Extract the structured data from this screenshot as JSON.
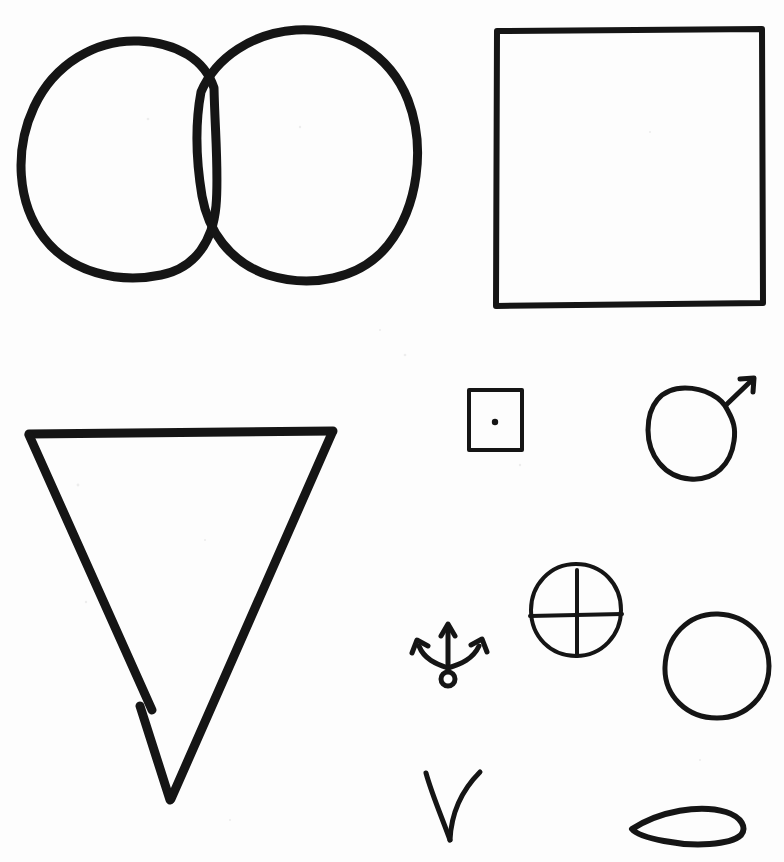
{
  "page": {
    "title": "Hand-drawn shapes sheet",
    "description": "Scanned sheet of hand-drawn black ink shapes on white paper",
    "width": 784,
    "height": 862,
    "background_color": "#fdfdfd",
    "ink_color": "#151515"
  },
  "shapes": [
    {
      "id": "two-overlapping-circles",
      "name": "two-overlapping-circles",
      "label": "Two overlapping circles (Venn / vesica)",
      "kind": "outline",
      "stroke_width": 9,
      "bbox": [
        22,
        28,
        398,
        255
      ],
      "parts": [
        {
          "part": "left-circle",
          "path": "M 214 88 C 205 60 178 43 139 41 C 96 39 54 64 34 107 C 14 150 17 203 44 238 C 70 272 118 284 161 275 C 196 268 213 240 216 206 C 219 174 215 133 214 88 Z"
        },
        {
          "part": "right-circle",
          "path": "M 201 92 C 216 57 253 33 296 30 C 345 27 390 54 408 100 C 426 147 418 207 388 245 C 360 280 310 288 268 275 C 229 262 208 230 202 196 C 196 160 195 124 201 92 Z"
        }
      ]
    },
    {
      "id": "large-square",
      "name": "large-square",
      "label": "Large hand-drawn square outline",
      "kind": "outline",
      "stroke_width": 6,
      "bbox": [
        494,
        27,
        270,
        280
      ],
      "parts": [
        {
          "part": "square-outline",
          "path": "M 497 31 L 762 29 L 763 303 L 496 306 Z"
        }
      ]
    },
    {
      "id": "inverted-triangle",
      "name": "inverted-triangle",
      "label": "Downward-pointing triangle with a small gap in the lower-left edge",
      "kind": "outline",
      "stroke_width": 9,
      "bbox": [
        26,
        428,
        310,
        375
      ],
      "vertices": [
        [
          29,
          433
        ],
        [
          332,
          432
        ],
        [
          170,
          800
        ]
      ],
      "parts": [
        {
          "part": "top-edge",
          "path": "M 29 434 L 333 431"
        },
        {
          "part": "right-edge",
          "path": "M 332 433 L 171 799"
        },
        {
          "part": "left-edge-upper",
          "path": "M 29 435 L 152 710"
        },
        {
          "part": "left-edge-lower",
          "path": "M 140 706 L 170 800"
        }
      ]
    },
    {
      "id": "small-square-with-dot",
      "name": "small-square-with-dot",
      "label": "Small square containing a centered dot",
      "kind": "outline",
      "stroke_width": 4,
      "bbox": [
        466,
        387,
        59,
        65
      ],
      "parts": [
        {
          "part": "square-outline",
          "path": "M 469 390 L 522 390 L 522 450 L 469 450 Z"
        },
        {
          "part": "center-dot",
          "dot": [
            495,
            422
          ],
          "radius": 3.2
        }
      ]
    },
    {
      "id": "circle-with-arrow",
      "name": "circle-with-arrow",
      "label": "Circle with a small arrow pointing up and to the right",
      "kind": "outline",
      "stroke_width": 5,
      "bbox": [
        645,
        376,
        116,
        105
      ],
      "parts": [
        {
          "part": "circle",
          "path": "M 728 411 C 722 397 704 388 685 388 C 661 388 648 405 648 430 C 648 455 664 477 690 479 C 715 481 731 464 734 441 C 736 428 733 420 728 411 Z"
        },
        {
          "part": "arrow-shaft",
          "path": "M 726 405 L 752 380"
        },
        {
          "part": "arrow-head",
          "path": "M 740 379 L 754 378 L 753 392"
        }
      ]
    },
    {
      "id": "crossed-circle",
      "name": "crossed-circle",
      "label": "Circle quartered by a vertical and a horizontal line (crosshair)",
      "kind": "outline",
      "stroke_width": 4,
      "bbox": [
        528,
        562,
        95,
        96
      ],
      "parts": [
        {
          "part": "circle",
          "path": "M 576 564 C 550 564 531 585 531 610 C 531 637 551 656 576 656 C 602 656 621 635 621 610 C 621 584 602 564 576 564 Z"
        },
        {
          "part": "vertical-line",
          "path": "M 577 570 L 577 656"
        },
        {
          "part": "horizontal-line",
          "path": "M 530 616 L 622 614"
        }
      ]
    },
    {
      "id": "anchor-symbol",
      "name": "anchor-symbol",
      "label": "Anchor / trident symbol: up arrow with two outward curving arrow arms and a small ring below",
      "kind": "outline",
      "stroke_width": 5,
      "bbox": [
        411,
        618,
        89,
        72
      ],
      "parts": [
        {
          "part": "stem",
          "path": "M 448 628 L 448 670"
        },
        {
          "part": "stem-arrow-head",
          "path": "M 441 636 L 448 624 L 455 636"
        },
        {
          "part": "left-arm",
          "path": "M 448 668 C 436 664 424 659 419 646"
        },
        {
          "part": "left-arm-head",
          "path": "M 412 653 L 417 640 L 428 646"
        },
        {
          "part": "right-arm",
          "path": "M 448 668 C 461 664 473 659 479 646"
        },
        {
          "part": "right-arm-head",
          "path": "M 471 645 L 482 639 L 487 652"
        },
        {
          "part": "ring",
          "circle": [
            448,
            679
          ],
          "radius": 7
        }
      ]
    },
    {
      "id": "plain-circle",
      "name": "plain-circle",
      "label": "Plain hand-drawn circle",
      "kind": "outline",
      "stroke_width": 5,
      "bbox": [
        662,
        612,
        110,
        108
      ],
      "parts": [
        {
          "part": "circle",
          "path": "M 718 614 C 688 613 666 637 665 667 C 664 696 687 718 717 718 C 747 718 769 695 769 666 C 769 637 747 615 718 614 Z"
        }
      ]
    },
    {
      "id": "check-curve",
      "name": "check-curve",
      "label": "Checkmark-like V with a curved right stroke",
      "kind": "outline",
      "stroke_width": 5,
      "bbox": [
        423,
        770,
        60,
        75
      ],
      "parts": [
        {
          "part": "left-stroke",
          "path": "M 426 773 C 432 795 443 820 450 840"
        },
        {
          "part": "right-stroke",
          "path": "M 450 840 C 451 818 459 793 480 772"
        }
      ]
    },
    {
      "id": "lens-shape",
      "name": "lens-shape",
      "label": "Lens / leaf (vesica) shape",
      "kind": "outline",
      "stroke_width": 6,
      "bbox": [
        629,
        803,
        120,
        45
      ],
      "parts": [
        {
          "part": "lens",
          "path": "M 632 829 C 660 811 700 804 726 812 C 742 817 747 828 741 835 C 730 845 694 847 664 841 C 648 838 636 834 632 829 Z"
        }
      ]
    }
  ],
  "speckles": [
    {
      "x": 148,
      "y": 119,
      "r": 1.3
    },
    {
      "x": 300,
      "y": 127,
      "r": 1.2
    },
    {
      "x": 380,
      "y": 330,
      "r": 1.1
    },
    {
      "x": 405,
      "y": 355,
      "r": 1.3
    },
    {
      "x": 650,
      "y": 132,
      "r": 1.1
    },
    {
      "x": 78,
      "y": 485,
      "r": 1.4
    },
    {
      "x": 205,
      "y": 540,
      "r": 1.1
    },
    {
      "x": 86,
      "y": 602,
      "r": 1.2
    },
    {
      "x": 520,
      "y": 465,
      "r": 1.2
    },
    {
      "x": 230,
      "y": 820,
      "r": 1.1
    },
    {
      "x": 700,
      "y": 760,
      "r": 1.1
    }
  ]
}
